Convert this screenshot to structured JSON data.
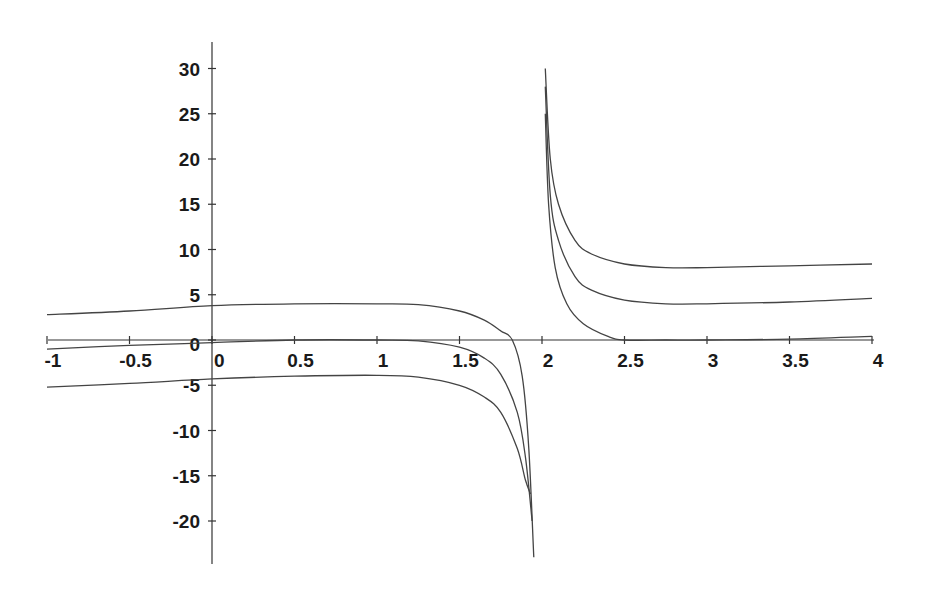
{
  "chart_data": {
    "type": "line",
    "title": "",
    "xlabel": "",
    "ylabel": "",
    "xlim": [
      -1,
      4
    ],
    "ylim": [
      -24,
      33
    ],
    "grid": false,
    "legend": null,
    "x_ticks": [
      -1,
      -0.5,
      0,
      0.5,
      1,
      1.5,
      2,
      2.5,
      3,
      3.5,
      4
    ],
    "x_tick_labels": [
      "-1",
      "-0.5",
      "0",
      "0.5",
      "1",
      "1.5",
      "2",
      "2.5",
      "3",
      "3.5",
      "4"
    ],
    "y_ticks": [
      30,
      25,
      20,
      15,
      10,
      5,
      0,
      -5,
      -10,
      -15,
      -20
    ],
    "y_tick_labels": [
      "30",
      "25",
      "20",
      "15",
      "10",
      "5",
      "0",
      "-5",
      "-10",
      "-15",
      "-20"
    ],
    "annotations": [
      "vertical asymptote near x = 2"
    ],
    "series": [
      {
        "name": "curve-upper-left",
        "x": [
          -1,
          -0.5,
          0,
          0.5,
          1,
          1.25,
          1.5,
          1.65,
          1.75,
          1.82,
          1.88,
          1.92,
          1.95
        ],
        "y": [
          2.8,
          3.2,
          3.8,
          4.0,
          4.0,
          3.9,
          3.2,
          2.2,
          1.0,
          0,
          -4,
          -12,
          -24
        ]
      },
      {
        "name": "curve-middle-left",
        "x": [
          -1,
          -0.5,
          0,
          0.5,
          1,
          1.25,
          1.5,
          1.65,
          1.75,
          1.85,
          1.9,
          1.94
        ],
        "y": [
          -1.0,
          -0.6,
          -0.3,
          0,
          0,
          -0.1,
          -0.8,
          -2.0,
          -3.8,
          -8,
          -13,
          -20
        ]
      },
      {
        "name": "curve-lower-left",
        "x": [
          -1,
          -0.5,
          0,
          0.5,
          1,
          1.25,
          1.5,
          1.65,
          1.75,
          1.85,
          1.9,
          1.93
        ],
        "y": [
          -5.2,
          -4.8,
          -4.3,
          -4.0,
          -3.9,
          -4.1,
          -5.0,
          -6.3,
          -8.0,
          -12,
          -15.5,
          -17
        ]
      },
      {
        "name": "curve-upper-right",
        "x": [
          2.02,
          2.05,
          2.1,
          2.2,
          2.3,
          2.5,
          2.75,
          3,
          3.5,
          4
        ],
        "y": [
          30,
          20,
          15,
          11,
          9.5,
          8.4,
          8.0,
          8.0,
          8.2,
          8.4
        ]
      },
      {
        "name": "curve-middle-right",
        "x": [
          2.02,
          2.05,
          2.1,
          2.2,
          2.3,
          2.5,
          2.75,
          3,
          3.5,
          4
        ],
        "y": [
          28,
          16,
          11,
          7.0,
          5.5,
          4.4,
          4.0,
          4.0,
          4.2,
          4.6
        ]
      },
      {
        "name": "curve-lower-right",
        "x": [
          2.02,
          2.04,
          2.08,
          2.15,
          2.25,
          2.4,
          2.5,
          2.75,
          3,
          3.5,
          4
        ],
        "y": [
          25,
          15,
          8,
          4,
          1.8,
          0.4,
          0,
          0,
          0,
          0.1,
          0.4
        ]
      }
    ]
  }
}
